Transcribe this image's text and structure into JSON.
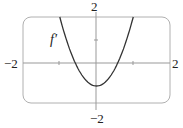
{
  "chart_data": {
    "type": "line",
    "title": "",
    "xlabel": "",
    "ylabel": "",
    "xlim": [
      -2,
      2
    ],
    "ylim": [
      -2,
      2
    ],
    "grid": false,
    "tick_labels": {
      "x_min": "−2",
      "x_max": "2",
      "y_min": "−2",
      "y_max": "2"
    },
    "series": [
      {
        "name": "f′",
        "formula": "approx 3x^2 - 1",
        "x": [
          -1.0,
          -0.8,
          -0.577,
          -0.4,
          -0.2,
          0.0,
          0.2,
          0.4,
          0.577,
          0.8,
          1.0
        ],
        "y": [
          2.0,
          0.92,
          0.0,
          -0.52,
          -0.88,
          -1.0,
          -0.88,
          -0.52,
          0.0,
          0.92,
          2.0
        ]
      }
    ],
    "annotations": [
      {
        "text": "f′",
        "x": -1.1,
        "y": 1.1
      }
    ],
    "colors": {
      "curve": "#333333",
      "axes": "#888888",
      "frame": "#aaaaaa"
    }
  }
}
